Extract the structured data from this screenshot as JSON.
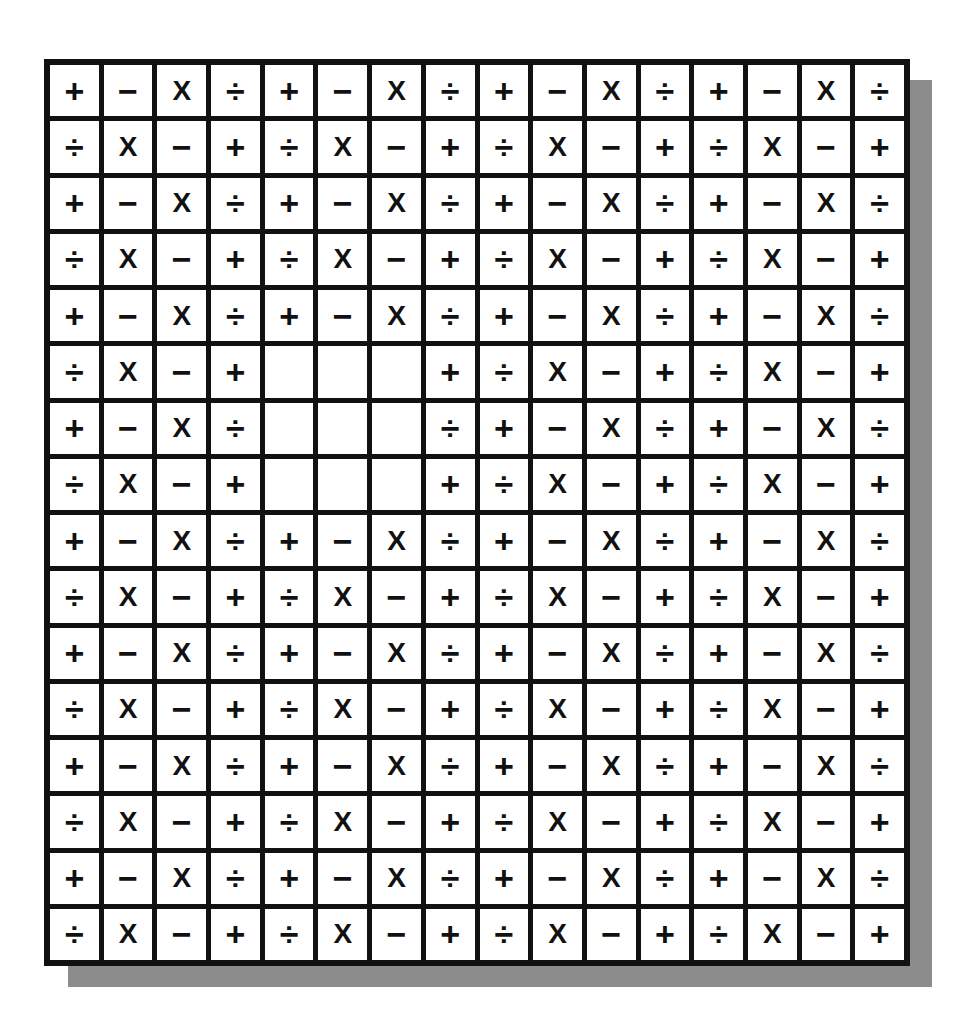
{
  "puzzle": {
    "rows": 16,
    "cols": 16,
    "colors": {
      "line": "#111111",
      "cell": "#ffffff",
      "shadow": "#8c8c8c",
      "symbol": "#111111"
    },
    "symbol_names": {
      "+": "plus",
      "−": "minus",
      "X": "x",
      "÷": "div"
    },
    "grid": [
      [
        "+",
        "−",
        "X",
        "÷",
        "+",
        "−",
        "X",
        "÷",
        "+",
        "−",
        "X",
        "÷",
        "+",
        "−",
        "X",
        "÷"
      ],
      [
        "÷",
        "X",
        "−",
        "+",
        "÷",
        "X",
        "−",
        "+",
        "÷",
        "X",
        "−",
        "+",
        "÷",
        "X",
        "−",
        "+"
      ],
      [
        "+",
        "−",
        "X",
        "÷",
        "+",
        "−",
        "X",
        "÷",
        "+",
        "−",
        "X",
        "÷",
        "+",
        "−",
        "X",
        "÷"
      ],
      [
        "÷",
        "X",
        "−",
        "+",
        "÷",
        "X",
        "−",
        "+",
        "÷",
        "X",
        "−",
        "+",
        "÷",
        "X",
        "−",
        "+"
      ],
      [
        "+",
        "−",
        "X",
        "÷",
        "+",
        "−",
        "X",
        "÷",
        "+",
        "−",
        "X",
        "÷",
        "+",
        "−",
        "X",
        "÷"
      ],
      [
        "÷",
        "X",
        "−",
        "+",
        "",
        "",
        "",
        "+",
        "÷",
        "X",
        "−",
        "+",
        "÷",
        "X",
        "−",
        "+"
      ],
      [
        "+",
        "−",
        "X",
        "÷",
        "",
        "",
        "",
        "÷",
        "+",
        "−",
        "X",
        "÷",
        "+",
        "−",
        "X",
        "÷"
      ],
      [
        "÷",
        "X",
        "−",
        "+",
        "",
        "",
        "",
        "+",
        "÷",
        "X",
        "−",
        "+",
        "÷",
        "X",
        "−",
        "+"
      ],
      [
        "+",
        "−",
        "X",
        "÷",
        "+",
        "−",
        "X",
        "÷",
        "+",
        "−",
        "X",
        "÷",
        "+",
        "−",
        "X",
        "÷"
      ],
      [
        "÷",
        "X",
        "−",
        "+",
        "÷",
        "X",
        "−",
        "+",
        "÷",
        "X",
        "−",
        "+",
        "÷",
        "X",
        "−",
        "+"
      ],
      [
        "+",
        "−",
        "X",
        "÷",
        "+",
        "−",
        "X",
        "÷",
        "+",
        "−",
        "X",
        "÷",
        "+",
        "−",
        "X",
        "÷"
      ],
      [
        "÷",
        "X",
        "−",
        "+",
        "÷",
        "X",
        "−",
        "+",
        "÷",
        "X",
        "−",
        "+",
        "÷",
        "X",
        "−",
        "+"
      ],
      [
        "+",
        "−",
        "X",
        "÷",
        "+",
        "−",
        "X",
        "÷",
        "+",
        "−",
        "X",
        "÷",
        "+",
        "−",
        "X",
        "÷"
      ],
      [
        "÷",
        "X",
        "−",
        "+",
        "÷",
        "X",
        "−",
        "+",
        "÷",
        "X",
        "−",
        "+",
        "÷",
        "X",
        "−",
        "+"
      ],
      [
        "+",
        "−",
        "X",
        "÷",
        "+",
        "−",
        "X",
        "÷",
        "+",
        "−",
        "X",
        "÷",
        "+",
        "−",
        "X",
        "÷"
      ],
      [
        "÷",
        "X",
        "−",
        "+",
        "÷",
        "X",
        "−",
        "+",
        "÷",
        "X",
        "−",
        "+",
        "÷",
        "X",
        "−",
        "+"
      ]
    ]
  }
}
